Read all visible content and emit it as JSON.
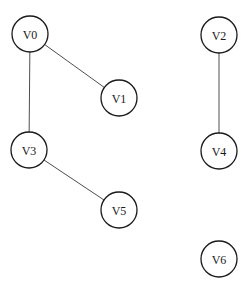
{
  "graph": {
    "type": "undirected",
    "style": {
      "node_radius": 18,
      "node_fill": "#ffffff",
      "node_stroke": "#1a1a1a",
      "edge_color": "#3a3a3a",
      "background": "#ffffff"
    },
    "nodes": [
      {
        "id": "V0",
        "label": "V0",
        "x": 30,
        "y": 34
      },
      {
        "id": "V1",
        "label": "V1",
        "x": 119,
        "y": 98
      },
      {
        "id": "V2",
        "label": "V2",
        "x": 219,
        "y": 35
      },
      {
        "id": "V3",
        "label": "V3",
        "x": 29,
        "y": 150
      },
      {
        "id": "V4",
        "label": "V4",
        "x": 219,
        "y": 151
      },
      {
        "id": "V5",
        "label": "V5",
        "x": 119,
        "y": 210
      },
      {
        "id": "V6",
        "label": "V6",
        "x": 219,
        "y": 259
      }
    ],
    "edges": [
      {
        "from": "V0",
        "to": "V1"
      },
      {
        "from": "V0",
        "to": "V3"
      },
      {
        "from": "V3",
        "to": "V5"
      },
      {
        "from": "V2",
        "to": "V4"
      }
    ]
  }
}
